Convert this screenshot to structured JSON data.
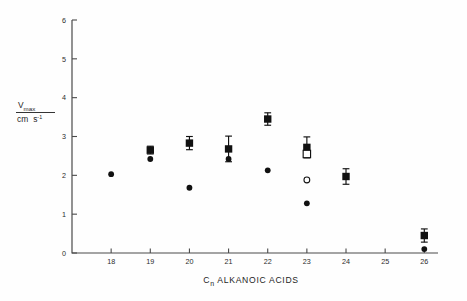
{
  "chart_data": {
    "type": "scatter",
    "title": "",
    "subtitle": "",
    "xlabel": "Cn ALKANOIC ACIDS",
    "xlabel_parts": {
      "prefix": "C",
      "subscript": "n",
      "suffix": " ALKANOIC ACIDS"
    },
    "ylabel": "Vmax / cm s-1",
    "ylabel_parts": {
      "numerator_main": "V",
      "numerator_sub": "max",
      "denominator_main": "cm",
      "denominator_unit": "s",
      "denominator_unit_sup": "-1"
    },
    "xticklabels": [
      "18",
      "19",
      "20",
      "21",
      "22",
      "23",
      "24",
      "25",
      "26"
    ],
    "xtickvalues": [
      18,
      19,
      20,
      21,
      22,
      23,
      24,
      25,
      26
    ],
    "yticklabels": [
      "0",
      "1",
      "2",
      "3",
      "4",
      "5",
      "6"
    ],
    "ytickvalues": [
      0,
      1,
      2,
      3,
      4,
      5,
      6
    ],
    "xlim": [
      17.6,
      26.35
    ],
    "ylim": [
      0,
      6
    ],
    "grid": false,
    "legend": "none",
    "axis_note": "x axis has a break: category 26 follows 25 directly",
    "series": [
      {
        "name": "filled-square",
        "marker": "filled square",
        "color": "#111111",
        "points": [
          {
            "x": 19,
            "y": 2.65,
            "yerr": 0.1
          },
          {
            "x": 20,
            "y": 2.83,
            "yerr": 0.17
          },
          {
            "x": 21,
            "y": 2.68,
            "yerr": 0.33
          },
          {
            "x": 22,
            "y": 3.45,
            "yerr": 0.16
          },
          {
            "x": 23,
            "y": 2.72,
            "yerr": 0.27
          },
          {
            "x": 24,
            "y": 1.97,
            "yerr": 0.2
          },
          {
            "x": 26,
            "y": 0.45,
            "yerr": 0.17
          }
        ]
      },
      {
        "name": "open-square",
        "marker": "open square",
        "color": "#111111",
        "points": [
          {
            "x": 23,
            "y": 2.55,
            "yerr": 0
          }
        ]
      },
      {
        "name": "filled-circle",
        "marker": "filled circle",
        "color": "#111111",
        "points": [
          {
            "x": 18,
            "y": 2.03,
            "yerr": 0
          },
          {
            "x": 19,
            "y": 2.42,
            "yerr": 0
          },
          {
            "x": 20,
            "y": 1.68,
            "yerr": 0
          },
          {
            "x": 21,
            "y": 2.42,
            "yerr": 0
          },
          {
            "x": 22,
            "y": 2.13,
            "yerr": 0
          },
          {
            "x": 23,
            "y": 1.28,
            "yerr": 0
          },
          {
            "x": 26,
            "y": 0.1,
            "yerr": 0
          }
        ]
      },
      {
        "name": "open-circle",
        "marker": "open circle",
        "color": "#111111",
        "points": [
          {
            "x": 23,
            "y": 1.88,
            "yerr": 0
          }
        ]
      }
    ]
  },
  "colors": {
    "axis": "#4a4a4a",
    "marker": "#111111",
    "background": "#fefefe",
    "text": "#1d1d1d"
  }
}
